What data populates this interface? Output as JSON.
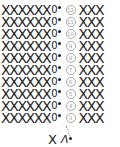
{
  "chart": {
    "rows": [
      {
        "number": "12",
        "left": "XXXXXX",
        "chain": "0",
        "right": "XXX"
      },
      {
        "number": "11",
        "left": "XXXXXX",
        "chain": "0",
        "right": "XXX"
      },
      {
        "number": "10",
        "left": "XXXXXX",
        "chain": "0",
        "right": "XXX"
      },
      {
        "number": "9",
        "left": "XXXXXX",
        "chain": "0",
        "right": "XXX"
      },
      {
        "number": "8",
        "left": "XXXXXX",
        "chain": "0",
        "right": "XXX"
      },
      {
        "number": "7",
        "left": "XXXXXX",
        "chain": "0",
        "right": "XXX"
      },
      {
        "number": "6",
        "left": "XXXXXX",
        "chain": "0",
        "right": "XXX"
      },
      {
        "number": "5",
        "left": "XXXXXX",
        "chain": "0",
        "right": "XXX"
      },
      {
        "number": "4",
        "left": "XXXXXX",
        "chain": "0",
        "right": "XXX"
      },
      {
        "number": "3",
        "left": "XXXXXX",
        "chain": "0",
        "right": "XXX"
      }
    ],
    "base": {
      "stitch": "X",
      "increase": "Λ"
    }
  },
  "icons": {
    "single_crochet": "×",
    "chain": "0",
    "slip_stitch": "•"
  }
}
